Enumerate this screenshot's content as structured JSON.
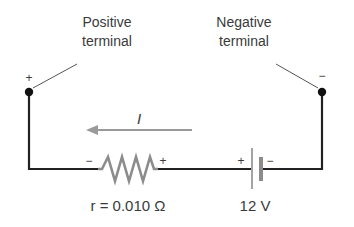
{
  "diagram": {
    "positive_terminal": {
      "line1": "Positive",
      "line2": "terminal",
      "sign": "+"
    },
    "negative_terminal": {
      "line1": "Negative",
      "line2": "terminal",
      "sign": "−"
    },
    "current": {
      "label": "I",
      "direction": "left"
    },
    "resistor": {
      "label": "r = 0.010 Ω",
      "left_sign": "−",
      "right_sign": "+"
    },
    "battery": {
      "label": "12 V",
      "left_sign": "+",
      "right_sign": "−"
    },
    "colors": {
      "wire": "#222222",
      "component": "#8c8c8c",
      "text": "#3a3a3a"
    }
  }
}
